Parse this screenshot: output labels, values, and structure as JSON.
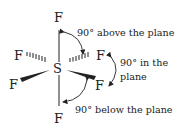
{
  "diagram": {
    "central_atom": "S",
    "atoms": {
      "top": "F",
      "bottom": "F",
      "left_back": "F",
      "right_back": "F",
      "left_front": "F",
      "right_front": "F"
    },
    "labels": {
      "above": "90° above the plane",
      "in_line1": "90° in the",
      "in_line2": "plane",
      "below": "90° below the plane"
    },
    "colors": {
      "ink": "#222222",
      "background": "#ffffff"
    }
  }
}
